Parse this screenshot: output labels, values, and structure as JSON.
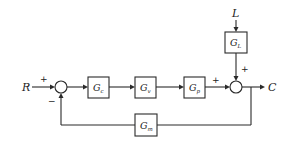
{
  "diagram": {
    "type": "control-system-block-diagram",
    "signals": {
      "input": "R",
      "output": "C",
      "load": "L"
    },
    "blocks": [
      {
        "id": "controller",
        "symbol": "G",
        "subscript": "c",
        "x": 88,
        "y": 77,
        "w": 21,
        "h": 21
      },
      {
        "id": "valve",
        "symbol": "G",
        "subscript": "v",
        "x": 135,
        "y": 77,
        "w": 21,
        "h": 21
      },
      {
        "id": "process",
        "symbol": "G",
        "subscript": "p",
        "x": 184,
        "y": 77,
        "w": 21,
        "h": 21
      },
      {
        "id": "load",
        "symbol": "G",
        "subscript": "L",
        "x": 225,
        "y": 32,
        "w": 22,
        "h": 21
      },
      {
        "id": "measurement",
        "symbol": "G",
        "subscript": "m",
        "x": 135,
        "y": 114,
        "w": 22,
        "h": 22
      }
    ],
    "summing_junctions": [
      {
        "id": "comparator",
        "cx": 61,
        "cy": 87,
        "r": 6,
        "signs": {
          "left": "+",
          "bottom": "−"
        }
      },
      {
        "id": "load-sum",
        "cx": 236,
        "cy": 87,
        "r": 6,
        "signs": {
          "left": "+",
          "top": "+"
        }
      }
    ],
    "sign_labels": {
      "r_plus": "+",
      "feedback_minus": "−",
      "process_plus": "+",
      "load_plus": "+"
    },
    "connections": [
      {
        "from": "R",
        "to": "comparator"
      },
      {
        "from": "comparator",
        "to": "controller"
      },
      {
        "from": "controller",
        "to": "valve"
      },
      {
        "from": "valve",
        "to": "process"
      },
      {
        "from": "process",
        "to": "load-sum",
        "sign": "+"
      },
      {
        "from": "L",
        "to": "load"
      },
      {
        "from": "load",
        "to": "load-sum",
        "sign": "+"
      },
      {
        "from": "load-sum",
        "to": "C"
      },
      {
        "from": "C",
        "to": "measurement",
        "note": "feedback branch"
      },
      {
        "from": "measurement",
        "to": "comparator",
        "sign": "−"
      }
    ],
    "colors": {
      "stroke": "#2a2a2a",
      "background": "#ffffff",
      "text": "#222222"
    }
  }
}
